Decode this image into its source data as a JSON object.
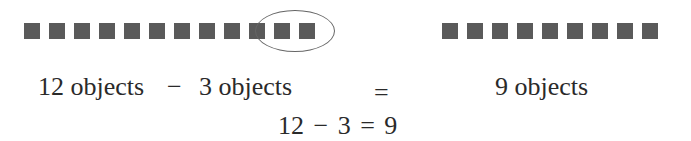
{
  "left_group": {
    "total_count": 12,
    "removed_count": 3,
    "removed_circled": true
  },
  "right_group": {
    "count": 9
  },
  "colors": {
    "square": "#5a5a5a",
    "ellipse": "#666666",
    "text": "#2a2a2a"
  },
  "equation_words": {
    "left_term": "12 objects",
    "minus": "−",
    "right_term": "3 objects",
    "equals": "=",
    "result": "9 objects"
  },
  "equation_numeric": "12 − 3 = 9"
}
